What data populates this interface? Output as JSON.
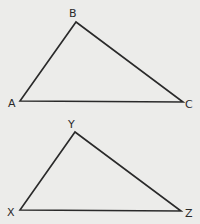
{
  "colors": {
    "background": "#ececea",
    "stroke": "#2a2a2a"
  },
  "triangles": [
    {
      "name": "ABC",
      "vertices": [
        {
          "label": "A",
          "x": 20,
          "y": 101,
          "lx": 8,
          "ly": 107
        },
        {
          "label": "B",
          "x": 76,
          "y": 22,
          "lx": 69,
          "ly": 17
        },
        {
          "label": "C",
          "x": 183,
          "y": 102,
          "lx": 185,
          "ly": 108
        }
      ]
    },
    {
      "name": "XYZ",
      "vertices": [
        {
          "label": "X",
          "x": 20,
          "y": 210,
          "lx": 7,
          "ly": 216
        },
        {
          "label": "Y",
          "x": 75,
          "y": 132,
          "lx": 68,
          "ly": 128
        },
        {
          "label": "Z",
          "x": 181,
          "y": 211,
          "lx": 185,
          "ly": 217
        }
      ]
    }
  ]
}
